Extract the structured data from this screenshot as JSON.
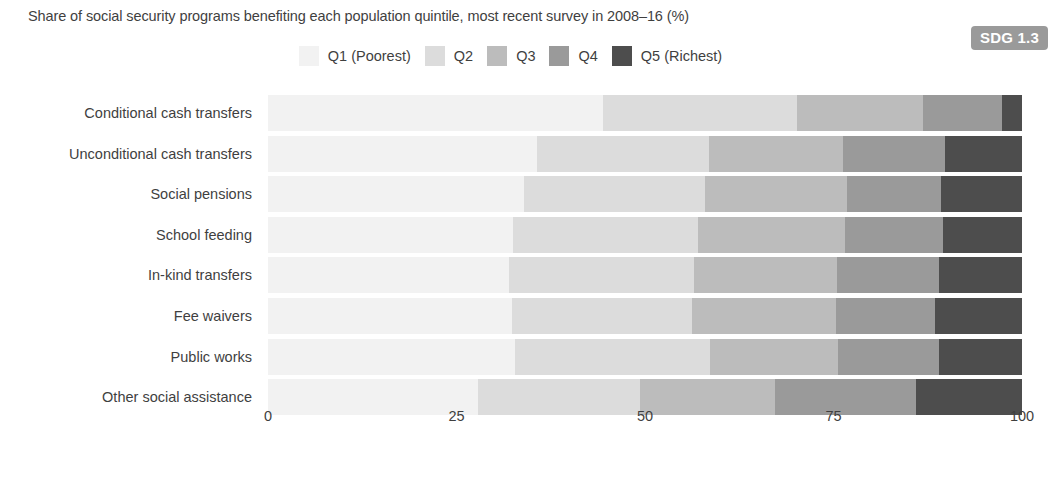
{
  "subtitle": "Share of social security programs benefiting each population quintile, most recent survey in 2008–16 (%)",
  "badge": {
    "label": "SDG 1.3",
    "bg": "#9a9a9a",
    "fg": "#ffffff"
  },
  "legend": {
    "items": [
      {
        "label": "Q1 (Poorest)",
        "color": "#f2f2f2"
      },
      {
        "label": "Q2",
        "color": "#dcdcdc"
      },
      {
        "label": "Q3",
        "color": "#bcbcbc"
      },
      {
        "label": "Q4",
        "color": "#9a9a9a"
      },
      {
        "label": "Q5 (Richest)",
        "color": "#4d4d4d"
      }
    ]
  },
  "chart_data": {
    "type": "bar",
    "orientation": "horizontal",
    "stacked": true,
    "stack_total": 100,
    "title": "",
    "subtitle": "Share of social security programs benefiting each population quintile, most recent survey in 2008–16 (%)",
    "xlabel": "",
    "ylabel": "",
    "xlim": [
      0,
      100
    ],
    "xticks": [
      0,
      25,
      50,
      75,
      100
    ],
    "xtick_labels": [
      "0",
      "25",
      "50",
      "75",
      "100"
    ],
    "grid": false,
    "legend_position": "top-center",
    "categories": [
      "Conditional cash transfers",
      "Unconditional cash transfers",
      "Social pensions",
      "School feeding",
      "In-kind transfers",
      "Fee waivers",
      "Public works",
      "Other social assistance"
    ],
    "series": [
      {
        "name": "Q1 (Poorest)",
        "color": "#f2f2f2",
        "values": [
          44.4,
          35.7,
          34.0,
          32.5,
          32.0,
          32.3,
          32.8,
          27.8
        ]
      },
      {
        "name": "Q2",
        "color": "#dcdcdc",
        "values": [
          25.8,
          22.8,
          24.0,
          24.5,
          24.5,
          24.0,
          25.8,
          21.5
        ]
      },
      {
        "name": "Q3",
        "color": "#bcbcbc",
        "values": [
          16.7,
          17.8,
          18.8,
          19.5,
          19.0,
          19.0,
          17.0,
          18.0
        ]
      },
      {
        "name": "Q4",
        "color": "#9a9a9a",
        "values": [
          10.4,
          13.5,
          12.5,
          13.0,
          13.5,
          13.2,
          13.4,
          18.7
        ]
      },
      {
        "name": "Q5 (Richest)",
        "color": "#4d4d4d",
        "values": [
          2.7,
          10.2,
          10.7,
          10.5,
          11.0,
          11.5,
          11.0,
          14.0
        ]
      }
    ]
  }
}
